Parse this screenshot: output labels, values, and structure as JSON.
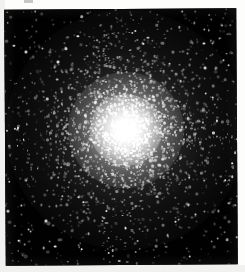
{
  "figure": {
    "kind": "astronomical-image"
  },
  "canvas": {
    "width": 245,
    "height": 272,
    "page_background": "#fdfdfc"
  },
  "plate": {
    "label": "sky-field",
    "left": 5,
    "top": 9,
    "width": 232,
    "height": 256,
    "rotation_deg": -0.35,
    "sky_color": "#010101",
    "star_color": "#ffffff"
  },
  "caption_remnant": {
    "label": "cut-off-caption-glyph",
    "left": 24,
    "top": 0,
    "width": 9,
    "height": 3,
    "color": "#9a9a9a"
  },
  "cluster": {
    "center_x": 124,
    "center_y": 124,
    "core_radius": 14,
    "halo_radius": 58,
    "outer_radius": 120,
    "core_color": "#ffffff",
    "halo_color": "#e8e8e8"
  },
  "chart_data": {
    "type": "scatter",
    "title": "",
    "xlabel": "",
    "ylabel": "",
    "grid": false,
    "legend": null,
    "background": "#010101",
    "point_color": "#ffffff",
    "center": [
      124,
      124
    ],
    "total_points": 2600,
    "radial_profile": {
      "bins_radius_px": [
        0,
        15,
        30,
        45,
        60,
        75,
        90,
        105,
        120,
        140
      ],
      "relative_density": [
        1.0,
        0.92,
        0.66,
        0.44,
        0.29,
        0.19,
        0.12,
        0.08,
        0.05,
        0.03
      ],
      "brightness": [
        1.0,
        0.95,
        0.8,
        0.65,
        0.55,
        0.48,
        0.42,
        0.38,
        0.35,
        0.33
      ]
    },
    "seed": 20240517
  }
}
